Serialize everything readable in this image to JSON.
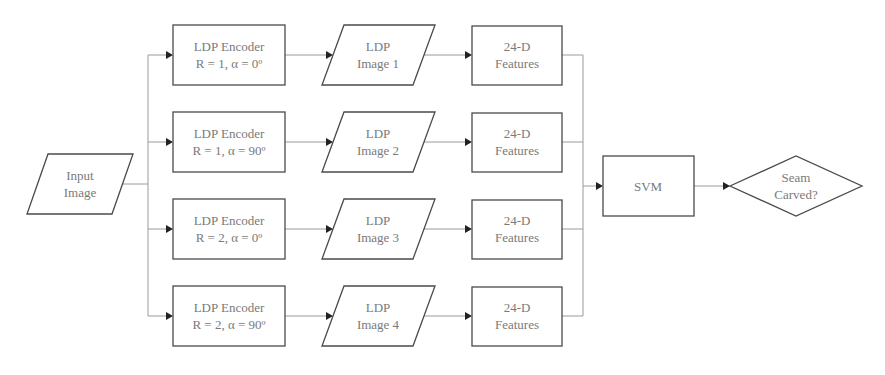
{
  "diagram": {
    "type": "flowchart",
    "input": {
      "line1": "Input",
      "line2": "Image"
    },
    "rows": [
      {
        "encoder": {
          "line1": "LDP Encoder",
          "line2": "R = 1, α = 0º"
        },
        "image": {
          "line1": "LDP",
          "line2": "Image 1"
        },
        "features": {
          "line1": "24-D",
          "line2": "Features"
        }
      },
      {
        "encoder": {
          "line1": "LDP Encoder",
          "line2": "R = 1, α = 90º"
        },
        "image": {
          "line1": "LDP",
          "line2": "Image 2"
        },
        "features": {
          "line1": "24-D",
          "line2": "Features"
        }
      },
      {
        "encoder": {
          "line1": "LDP Encoder",
          "line2": "R = 2, α = 0º"
        },
        "image": {
          "line1": "LDP",
          "line2": "Image 3"
        },
        "features": {
          "line1": "24-D",
          "line2": "Features"
        }
      },
      {
        "encoder": {
          "line1": "LDP Encoder",
          "line2": "R = 2, α = 90º"
        },
        "image": {
          "line1": "LDP",
          "line2": "Image 4"
        },
        "features": {
          "line1": "24-D",
          "line2": "Features"
        }
      }
    ],
    "classifier": {
      "label": "SVM"
    },
    "decision": {
      "line1": "Seam",
      "line2": "Carved?"
    },
    "colors": {
      "border": "#4a4a4a",
      "text": "#7a7a7a",
      "connector": "#9a9a9a",
      "arrowhead": "#222222"
    }
  }
}
